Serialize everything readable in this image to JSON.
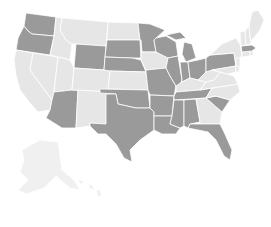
{
  "map": {
    "type": "us-states-choropleth",
    "colors": {
      "highlighted": "#9a9a9a",
      "default": "#e6e6e6",
      "faint": "#f0f0f0",
      "background": "#ffffff"
    },
    "highlighted_states": [
      "WA",
      "OR",
      "AZ",
      "WY",
      "SD",
      "NE",
      "OK",
      "TX",
      "MN",
      "WI",
      "MI",
      "IL",
      "IN",
      "OH",
      "PA",
      "MA",
      "MO",
      "AR",
      "LA",
      "MS",
      "AL",
      "TN",
      "SC",
      "FL"
    ],
    "default_states": [
      "CA",
      "NV",
      "ID",
      "MT",
      "UT",
      "CO",
      "NM",
      "ND",
      "KS",
      "IA",
      "KY",
      "WV",
      "VA",
      "NC",
      "GA",
      "NY",
      "VT",
      "NH",
      "ME",
      "CT",
      "RI",
      "NJ",
      "DE",
      "MD",
      "AK",
      "HI"
    ]
  }
}
